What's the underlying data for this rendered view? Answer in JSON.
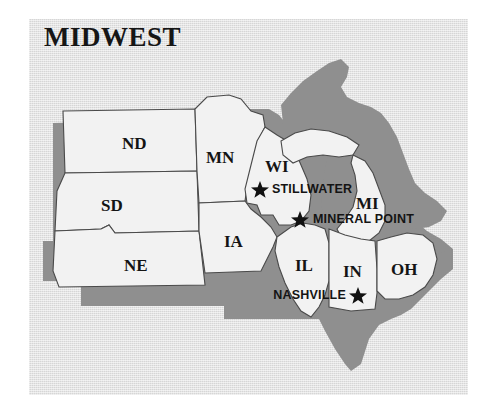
{
  "figure": {
    "title": "MIDWEST",
    "kind": "reference-map",
    "region": "Midwest"
  },
  "colors": {
    "page_background": "#ffffff",
    "panel_background": "#d6d6d6",
    "state_fill": "#f2f2f2",
    "water_and_shadow": "#8f8f8f",
    "outline": "#4a4a4a",
    "text": "#141414"
  },
  "states": [
    {
      "code": "ND",
      "label_x": 120,
      "label_y": 126
    },
    {
      "code": "SD",
      "label_x": 97,
      "label_y": 188
    },
    {
      "code": "NE",
      "label_x": 112,
      "label_y": 249
    },
    {
      "code": "MN",
      "label_x": 190,
      "label_y": 149
    },
    {
      "code": "IA",
      "label_x": 210,
      "label_y": 227
    },
    {
      "code": "WI",
      "label_x": 254,
      "label_y": 154
    },
    {
      "code": "MI",
      "label_x": 338,
      "label_y": 185
    },
    {
      "code": "IL",
      "label_x": 283,
      "label_y": 248
    },
    {
      "code": "IN",
      "label_x": 334,
      "label_y": 256
    },
    {
      "code": "OH",
      "label_x": 377,
      "label_y": 254
    }
  ],
  "cities": [
    {
      "name": "STILLWATER",
      "star_x": 230,
      "star_y": 169,
      "label_x": 243,
      "label_y": 174,
      "label_side": "right"
    },
    {
      "name": "MINERAL POINT",
      "star_x": 270,
      "star_y": 199,
      "label_x": 284,
      "label_y": 204,
      "label_side": "right"
    },
    {
      "name": "NASHVILLE",
      "star_x": 328,
      "star_y": 275,
      "label_x": 322,
      "label_y": 280,
      "label_side": "left"
    }
  ]
}
